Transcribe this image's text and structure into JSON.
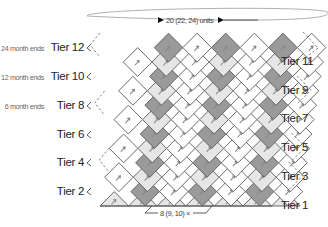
{
  "diagram": {
    "colors": {
      "background": "#ffffff",
      "grid_line": "#5a5a5a",
      "dark_fill": "#9a9a9a",
      "light_fill": "#e6e6e6",
      "white_fill": "#ffffff",
      "arrow": "#8a8a8a",
      "dashed": "#777777",
      "text": "#222222",
      "note_text": "#666666"
    },
    "width_annotation": {
      "label": "20 (22, 24) units",
      "icon": "double-arrow-width"
    },
    "height_annotation": {
      "label": "8 (9, 10)",
      "suffix_icon": "multiply-x-icon"
    },
    "left_tiers": [
      {
        "label": "Tier 12",
        "note": "24 month ends",
        "y": 47,
        "dashed": true
      },
      {
        "label": "Tier 10",
        "note": "12 month ends",
        "y": 76,
        "dashed": false
      },
      {
        "label": "Tier 8",
        "note": "6 month ends",
        "y": 105,
        "dashed": true
      },
      {
        "label": "Tier 6",
        "note": "",
        "y": 134,
        "dashed": false
      },
      {
        "label": "Tier 4",
        "note": "",
        "y": 162,
        "dashed": true
      },
      {
        "label": "Tier 2",
        "note": "",
        "y": 191,
        "dashed": false
      }
    ],
    "right_tiers": [
      {
        "label": "Tier 11",
        "y": 61
      },
      {
        "label": "Tier 9",
        "y": 90
      },
      {
        "label": "Tier 7",
        "y": 118
      },
      {
        "label": "Tier 5",
        "y": 147
      },
      {
        "label": "Tier 3",
        "y": 176
      },
      {
        "label": "Tier 1",
        "y": 205
      }
    ],
    "grid": {
      "origin_x": 100,
      "bottom_y": 206,
      "half_w": 14.3,
      "half_h": 14.4,
      "rows": 12,
      "cols": 6,
      "shade_pattern": "diagonal",
      "dark_period": 4
    }
  }
}
